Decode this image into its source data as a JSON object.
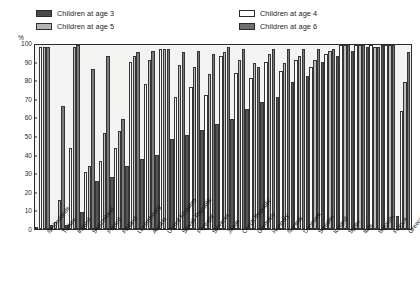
{
  "axis": {
    "unit_label": "%",
    "y_ticks": [
      0,
      10,
      20,
      30,
      40,
      50,
      60,
      70,
      80,
      90,
      100
    ]
  },
  "legend": {
    "items": [
      {
        "label": "Children at age 3",
        "key": "age3",
        "color": "#4a4a4a",
        "swatch": "sw-a3"
      },
      {
        "label": "Children at age 4",
        "key": "age4",
        "color": "#ffffff",
        "swatch": "sw-a4"
      },
      {
        "label": "Children at age 5",
        "key": "age5",
        "color": "#b4b4b4",
        "swatch": "sw-a5"
      },
      {
        "label": "Children at age 6",
        "key": "age6",
        "color": "#6e6e6e",
        "swatch": "sw-a6"
      }
    ]
  },
  "chart_data": {
    "type": "bar",
    "title": "",
    "subtitle": "",
    "xlabel": "",
    "ylabel": "%",
    "ylim": [
      0,
      100
    ],
    "grid": false,
    "legend_position": "top",
    "categories": [
      "Netherlands",
      "Turkey",
      "Ireland",
      "Switzerland",
      "Poland",
      "Finland",
      "Luxembourg",
      "Austria",
      "United Kingdom",
      "Slovak Republic",
      "Portugal",
      "Slovenia",
      "Japan",
      "Czech Republic",
      "Germany",
      "Hungary",
      "Norway",
      "Denmark",
      "Sweden",
      "Iceland",
      "Spain",
      "Italy",
      "Belgium",
      "France",
      "Greece"
    ],
    "series": [
      {
        "name": "Children at age 3",
        "key": "age3",
        "values": [
          0,
          2,
          2,
          9,
          26,
          28,
          34,
          38,
          40,
          49,
          51,
          54,
          57,
          60,
          65,
          69,
          72,
          80,
          83,
          91,
          94,
          97,
          99,
          100,
          7
        ]
      },
      {
        "name": "Children at age 4",
        "key": "age4",
        "values": [
          99,
          4,
          44,
          31,
          37,
          44,
          91,
          79,
          98,
          72,
          77,
          73,
          94,
          85,
          82,
          91,
          86,
          92,
          88,
          95,
          100,
          100,
          100,
          100,
          64
        ]
      },
      {
        "name": "Children at age 5",
        "key": "age5",
        "values": [
          99,
          16,
          99,
          34,
          52,
          53,
          94,
          92,
          98,
          89,
          88,
          84,
          96,
          92,
          90,
          95,
          90,
          94,
          92,
          97,
          100,
          100,
          99,
          100,
          80
        ]
      },
      {
        "name": "Children at age 6",
        "key": "age6",
        "values": [
          99,
          67,
          100,
          87,
          94,
          60,
          96,
          97,
          98,
          96,
          97,
          95,
          99,
          98,
          88,
          98,
          98,
          98,
          98,
          98,
          100,
          100,
          99,
          100,
          96
        ]
      }
    ]
  }
}
